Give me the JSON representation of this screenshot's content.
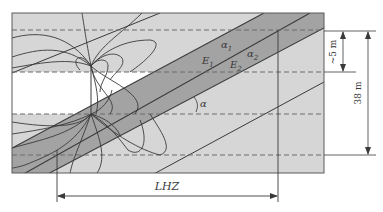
{
  "figure": {
    "type": "geological cross-section with dipole field lines",
    "colors": {
      "host_rock": "#d6d6d6",
      "dark_band": "#a3a3a3",
      "bottom_dark": "#b0b0b0",
      "white_layer": "#ffffff",
      "lines": "#3a3a3a",
      "dashed": "#6a6a6a"
    }
  },
  "labels": {
    "alpha1": "α",
    "alpha1_sub": "1",
    "alpha2": "α",
    "alpha2_sub": "2",
    "E1": "E",
    "E1_sub": "1",
    "E2": "E",
    "E2_sub": "2",
    "angle": "α",
    "lhz": "LHZ",
    "dim_small": "~5 m",
    "dim_large": "38 m"
  }
}
